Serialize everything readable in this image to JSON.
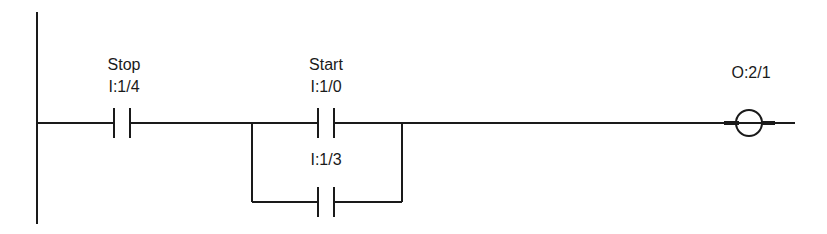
{
  "diagram": {
    "type": "ladder-logic",
    "colors": {
      "line": "#1a1a1a",
      "background": "#ffffff"
    },
    "rung": {
      "elements": [
        {
          "kind": "normally-open-contact",
          "name": "Stop",
          "address": "I:1/4"
        },
        {
          "kind": "parallel-branch",
          "elements": [
            {
              "kind": "normally-open-contact",
              "name": "Start",
              "address": "I:1/0"
            },
            {
              "kind": "normally-open-contact",
              "name": "",
              "address": "I:1/3"
            }
          ]
        },
        {
          "kind": "output-coil",
          "address": "O:2/1"
        }
      ]
    },
    "labels": {
      "stop_name": "Stop",
      "stop_addr": "I:1/4",
      "start_name": "Start",
      "start_addr": "I:1/0",
      "seal_addr": "I:1/3",
      "coil_addr": "O:2/1"
    }
  }
}
